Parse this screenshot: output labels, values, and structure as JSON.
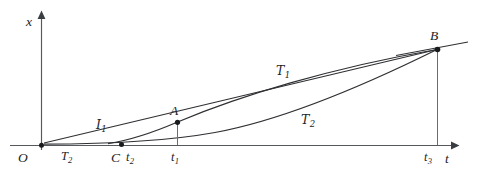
{
  "figure": {
    "kind": "coordinate-diagram",
    "background": "#ffffff",
    "ink_color": "#2f3033",
    "axes": {
      "vertical_label": "x",
      "horizontal_label": "t",
      "origin_label": "O"
    },
    "points": [
      {
        "id": "O",
        "label": "O",
        "x": 41,
        "y": 145
      },
      {
        "id": "C",
        "label": "C",
        "x": 121,
        "y": 145
      },
      {
        "id": "A",
        "label": "A",
        "x": 177,
        "y": 122
      },
      {
        "id": "B",
        "label": "B",
        "x": 437,
        "y": 49
      }
    ],
    "tick_labels": [
      {
        "id": "t2",
        "base": "t",
        "sub": "2",
        "x": 132,
        "y": 152
      },
      {
        "id": "t1",
        "base": "t",
        "sub": "1",
        "x": 170,
        "y": 152
      },
      {
        "id": "t3",
        "base": "t",
        "sub": "3",
        "x": 425,
        "y": 152
      }
    ],
    "curve_labels": [
      {
        "id": "I1",
        "base": "I",
        "sub": "1",
        "x": 98,
        "y": 120,
        "style": "script"
      },
      {
        "id": "T2",
        "base": "T",
        "sub": "2",
        "x": 62,
        "y": 150,
        "style": "italic"
      },
      {
        "id": "T1",
        "base": "T",
        "sub": "1",
        "x": 277,
        "y": 66,
        "style": "script"
      },
      {
        "id": "T2b",
        "base": "T",
        "sub": "2",
        "x": 302,
        "y": 115,
        "style": "script"
      }
    ],
    "geometry_notes": {
      "upper_curve": "passes through C, A and rises to B",
      "lower_curve": "leaves the origin region flat and rises steeply to B",
      "chord": "straight segment from near the origin to B",
      "tangent": "short ray continuing past B to the upper right",
      "drop_lines": [
        "A to t1 on the t axis",
        "B to t3 on the t axis"
      ]
    }
  }
}
